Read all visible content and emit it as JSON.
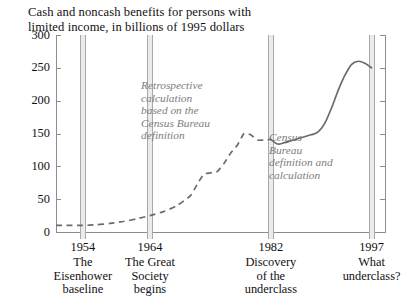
{
  "chart_data": {
    "type": "line",
    "title": "Cash and noncash benefits for persons with\nlimited income, in billions of 1995 dollars",
    "xlabel": "",
    "ylabel": "",
    "ylim": [
      0,
      300
    ],
    "xlim": [
      1950,
      1999
    ],
    "yticks": [
      0,
      50,
      100,
      150,
      200,
      250,
      300
    ],
    "grid": false,
    "legend": false,
    "annotations": [
      {
        "text": "Retrospective\ncalculation\nbased on the\nCensus Bureau\ndefinition",
        "x": 1962,
        "y": 215,
        "color": "#7d7d7d",
        "style": "italic"
      },
      {
        "text": "Census\nBureau\ndefinition and\ncalculation",
        "x": 1983,
        "y": 135,
        "color": "#7d7d7d",
        "style": "italic"
      }
    ],
    "reference_bands": [
      {
        "year": 1954,
        "label_year": "1954",
        "label_text": "The\nEisenhower\nbaseline"
      },
      {
        "year": 1964,
        "label_year": "1964",
        "label_text": "The Great\nSociety\nbegins"
      },
      {
        "year": 1982,
        "label_year": "1982",
        "label_text": "Discovery\nof the\nunderclass"
      },
      {
        "year": 1997,
        "label_year": "1997",
        "label_text": "What\nunderclass?"
      }
    ],
    "series": [
      {
        "name": "Retrospective calculation based on the Census Bureau definition",
        "style": "dashed",
        "color": "#6b6b6b",
        "x": [
          1950,
          1952,
          1954,
          1956,
          1958,
          1960,
          1962,
          1964,
          1966,
          1968,
          1970,
          1971,
          1972,
          1973,
          1974,
          1975,
          1976,
          1977,
          1978,
          1979,
          1980,
          1981,
          1982
        ],
        "values": [
          10,
          10,
          10,
          11,
          13,
          16,
          20,
          25,
          31,
          40,
          55,
          72,
          88,
          90,
          92,
          104,
          120,
          132,
          150,
          148,
          140,
          140,
          141
        ]
      },
      {
        "name": "Census Bureau definition and calculation",
        "style": "solid",
        "color": "#6b6b6b",
        "x": [
          1982,
          1983,
          1984,
          1985,
          1986,
          1987,
          1988,
          1989,
          1990,
          1991,
          1992,
          1993,
          1994,
          1995,
          1996,
          1997
        ],
        "values": [
          141,
          134,
          136,
          139,
          142,
          145,
          148,
          152,
          165,
          188,
          215,
          238,
          255,
          260,
          257,
          250
        ]
      }
    ]
  }
}
